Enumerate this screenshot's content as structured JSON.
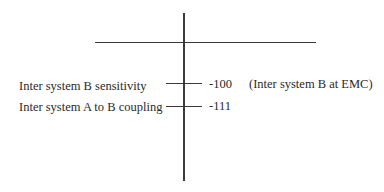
{
  "diagram": {
    "type": "level-scale",
    "levels": [
      {
        "label": "Inter system B sensitivity",
        "value": "-100",
        "note": "(Inter system B at EMC)"
      },
      {
        "label": "Inter system A to B coupling",
        "value": "-111",
        "note": ""
      }
    ]
  }
}
